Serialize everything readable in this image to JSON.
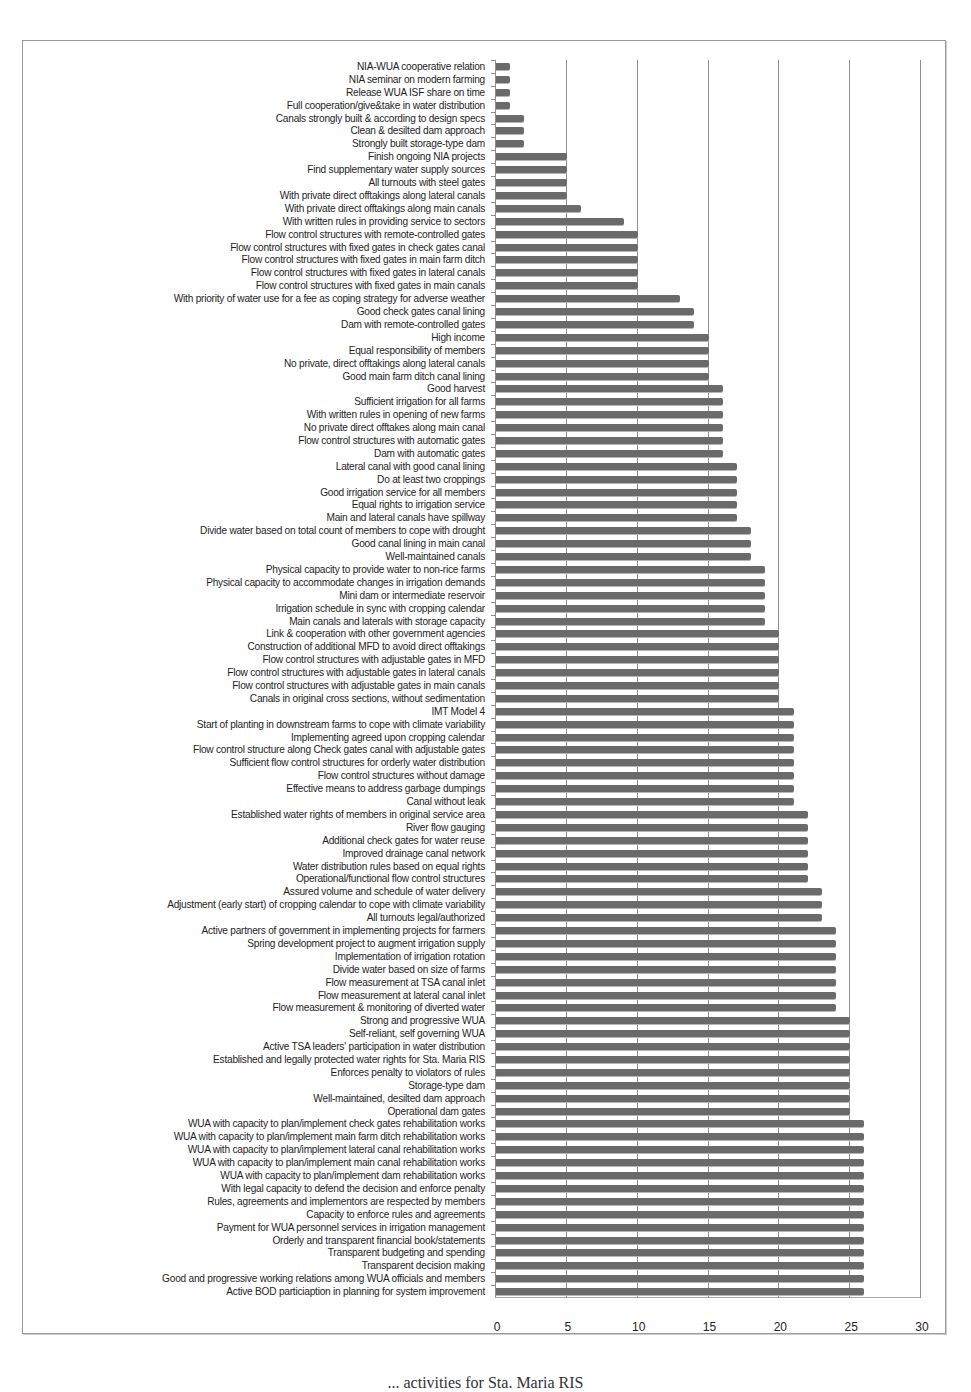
{
  "chart_data": {
    "type": "bar",
    "orientation": "horizontal",
    "title": "",
    "xlabel": "",
    "ylabel": "",
    "xlim": [
      0,
      30
    ],
    "x_ticks": [
      "0",
      "5",
      "10",
      "15",
      "20",
      "25",
      "30"
    ],
    "grid": true,
    "legend": null,
    "bar_color": "#6a6a6a",
    "categories": [
      "NIA-WUA cooperative relation",
      "NIA seminar on modern farming",
      "Release WUA ISF share on time",
      "Full cooperation/give&take in water distribution",
      "Canals strongly built & according to design specs",
      "Clean & desilted dam approach",
      "Strongly built storage-type dam",
      "Finish ongoing NIA projects",
      "Find supplementary water supply sources",
      "All turnouts with steel gates",
      "With private direct offtakings along lateral canals",
      "With private direct offtakings along main canals",
      "With written rules in providing service to sectors",
      "Flow control structures with remote-controlled gates",
      "Flow control structures with fixed gates in check gates canal",
      "Flow control structures with fixed gates in main farm ditch",
      "Flow control structures with fixed gates in lateral canals",
      "Flow control structures with fixed gates in main canals",
      "With priority of water use for a fee as coping strategy for adverse weather",
      "Good check gates canal lining",
      "Dam with remote-controlled gates",
      "High income",
      "Equal responsibility of members",
      "No private, direct offtakings along lateral canals",
      "Good main farm ditch canal lining",
      "Good harvest",
      "Sufficient irrigation for all farms",
      "With written rules in opening of new farms",
      "No private direct offtakes along main canal",
      "Flow control structures with automatic gates",
      "Dam with automatic gates",
      "Lateral canal with good canal lining",
      "Do at least two croppings",
      "Good irrigation service for all members",
      "Equal rights to irrigation service",
      "Main and lateral canals have spillway",
      "Divide water based on total count of members to cope with drought",
      "Good canal lining in main canal",
      "Well-maintained canals",
      "Physical capacity to provide water to non-rice farms",
      "Physical capacity to accommodate changes in irrigation demands",
      "Mini dam or intermediate reservoir",
      "Irrigation schedule in sync with cropping calendar",
      "Main canals and laterals with storage capacity",
      "Link & cooperation with other government agencies",
      "Construction of additional MFD to avoid direct offtakings",
      "Flow control structures with adjustable gates in MFD",
      "Flow control structures with adjustable gates in lateral canals",
      "Flow control structures with adjustable gates in main canals",
      "Canals in original cross sections, without sedimentation",
      "IMT Model 4",
      "Start of planting in downstream farms to cope with climate variability",
      "Implementing agreed upon cropping calendar",
      "Flow control structure along Check gates canal with adjustable gates",
      "Sufficient flow control structures for orderly water distribution",
      "Flow control structures without damage",
      "Effective means to address garbage dumpings",
      "Canal without leak",
      "Established water rights of members in original service area",
      "River flow gauging",
      "Additional check gates for water reuse",
      "Improved drainage canal network",
      "Water distribution rules based on equal rights",
      "Operational/functional flow control structures",
      "Assured volume and schedule of water delivery",
      "Adjustment (early start) of cropping calendar to cope with climate variability",
      "All turnouts legal/authorized",
      "Active partners of government in implementing projects for farmers",
      "Spring development project to augment irrigation supply",
      "Implementation of irrigation rotation",
      "Divide water based on size of farms",
      "Flow measurement at TSA canal inlet",
      "Flow measurement at lateral canal inlet",
      "Flow measurement & monitoring of diverted water",
      "Strong and progressive WUA",
      "Self-reliant, self governing WUA",
      "Active TSA leaders' participation in water distribution",
      "Established and legally protected water rights for Sta. Maria RIS",
      "Enforces penalty to violators of rules",
      "Storage-type dam",
      "Well-maintained, desilted dam approach",
      "Operational dam gates",
      "WUA with capacity to plan/implement check gates rehabilitation works",
      "WUA with capacity to plan/implement main farm ditch rehabilitation works",
      "WUA with capacity to plan/implement lateral canal rehabilitation works",
      "WUA with capacity to plan/implement main canal rehabilitation works",
      "WUA with capacity to plan/implement dam rehabilitation works",
      "With legal capacity to defend the decision and enforce penalty",
      "Rules, agreements and implementors are respected by members",
      "Capacity to enforce rules and agreements",
      "Payment for WUA personnel services in irrigation management",
      "Orderly and transparent financial book/statements",
      "Transparent budgeting and spending",
      "Transparent decision making",
      "Good and progressive working relations among WUA officials and members",
      "Active BOD particiaption in planning for system improvement"
    ],
    "values": [
      1,
      1,
      1,
      1,
      2,
      2,
      2,
      5,
      5,
      5,
      5,
      6,
      9,
      10,
      10,
      10,
      10,
      10,
      13,
      14,
      14,
      15,
      15,
      15,
      15,
      16,
      16,
      16,
      16,
      16,
      16,
      17,
      17,
      17,
      17,
      17,
      18,
      18,
      18,
      19,
      19,
      19,
      19,
      19,
      20,
      20,
      20,
      20,
      20,
      20,
      21,
      21,
      21,
      21,
      21,
      21,
      21,
      21,
      22,
      22,
      22,
      22,
      22,
      22,
      23,
      23,
      23,
      24,
      24,
      24,
      24,
      24,
      24,
      24,
      25,
      25,
      25,
      25,
      25,
      25,
      25,
      25,
      26,
      26,
      26,
      26,
      26,
      26,
      26,
      26,
      26,
      26,
      26,
      26,
      26,
      26
    ]
  },
  "caption": "... activities for Sta. Maria RIS"
}
